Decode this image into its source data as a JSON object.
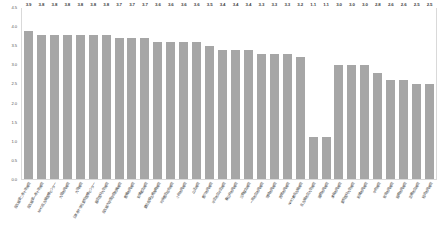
{
  "chart_data": {
    "type": "bar",
    "title": "",
    "subtitle": "",
    "xlabel": "",
    "ylabel": "",
    "ylim": [
      0.0,
      4.5
    ],
    "ytick_labels": [
      "4.5",
      "4.0",
      "3.5",
      "3.0",
      "2.5",
      "2.0",
      "1.5",
      "1.0",
      "0.5",
      "0.0"
    ],
    "ytick_values": [
      4.5,
      4.0,
      3.5,
      3.0,
      2.5,
      2.0,
      1.5,
      1.0,
      0.5,
      0.0
    ],
    "grid": false,
    "legend": null,
    "bar_color": "#a6a6a6",
    "categories": [
      "名古屋第二赤十字病院",
      "名古屋第一赤十字病院",
      "NHO名古屋医療センター",
      "大垣市民病院",
      "大同病院",
      "日本赤十字社愛知医療センター",
      "藤田医科大学病院",
      "名古屋大学医学部附属病院",
      "豊橋市民病院",
      "安城更生病院",
      "愛知県厚生連海南病院",
      "刈谷豊田総合病院",
      "小牧市民病院",
      "山王病院",
      "豊川市民病院",
      "半田市立半田病院",
      "春日井市民病院",
      "江南厚生病院",
      "一宮市立市民病院",
      "岡崎市民病院",
      "西尾市民病院",
      "NHO東名古屋病院",
      "名古屋市立大学病院",
      "蒲郡市民病院",
      "津島市民病院",
      "愛知医科大学病院",
      "新城市民病院",
      "中京病院",
      "常滑市民病院",
      "碧南市民病院",
      "田原市立病院",
      "稲沢市民病院"
    ],
    "values": [
      3.9,
      3.8,
      3.8,
      3.8,
      3.8,
      3.8,
      3.8,
      3.7,
      3.7,
      3.7,
      3.6,
      3.6,
      3.6,
      3.6,
      3.5,
      3.4,
      3.4,
      3.4,
      3.3,
      3.3,
      3.3,
      3.2,
      1.1,
      1.1,
      3.0,
      3.0,
      3.0,
      2.8,
      2.6,
      2.6,
      2.5,
      2.5
    ],
    "data_labels": [
      "3.9",
      "3.8",
      "3.8",
      "3.8",
      "3.8",
      "3.8",
      "3.8",
      "3.7",
      "3.7",
      "3.7",
      "3.6",
      "3.6",
      "3.6",
      "3.6",
      "3.5",
      "3.4",
      "3.4",
      "3.4",
      "3.3",
      "3.3",
      "3.3",
      "3.2",
      "1.1",
      "1.1",
      "3.0",
      "3.0",
      "3.0",
      "2.8",
      "2.6",
      "2.6",
      "2.5",
      "2.5"
    ]
  }
}
